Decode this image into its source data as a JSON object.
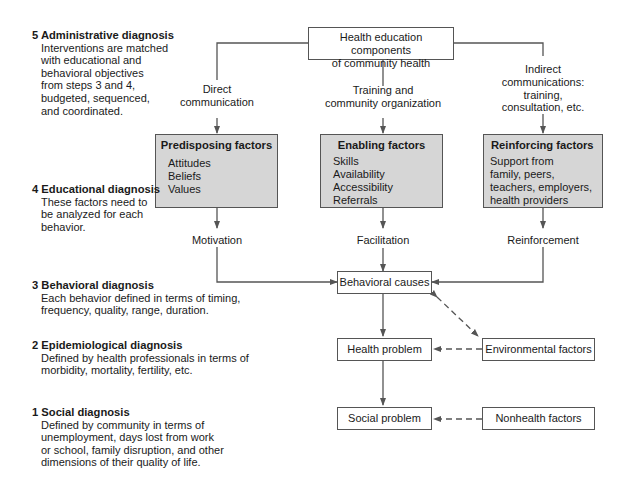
{
  "diagram": {
    "top_box": {
      "line1": "Health education components",
      "line2": "of community health"
    },
    "channels": {
      "direct": {
        "line1": "Direct",
        "line2": "communication"
      },
      "training": {
        "line1": "Training and",
        "line2": "community organization"
      },
      "indirect": {
        "line1": "Indirect",
        "line2": "communications:",
        "line3": "training,",
        "line4": "consultation, etc."
      }
    },
    "factors": {
      "predisposing": {
        "title": "Predisposing factors",
        "items": [
          "Attitudes",
          "Beliefs",
          "Values"
        ]
      },
      "enabling": {
        "title": "Enabling factors",
        "items": [
          "Skills",
          "Availability",
          "Accessibility",
          "Referrals"
        ]
      },
      "reinforcing": {
        "title": "Reinforcing factors",
        "items": [
          "Support from",
          "family, peers,",
          "teachers, employers,",
          "health providers"
        ]
      }
    },
    "outcomes": {
      "motivation": "Motivation",
      "facilitation": "Facilitation",
      "reinforcement": "Reinforcement"
    },
    "nodes": {
      "behavioral_causes": "Behavioral causes",
      "health_problem": "Health problem",
      "social_problem": "Social problem",
      "environmental_factors": "Environmental factors",
      "nonhealth_factors": "Nonhealth factors"
    },
    "steps": [
      {
        "title": "5 Administrative diagnosis",
        "lines": [
          "Interventions are matched",
          "with educational and",
          "behavioral objectives",
          "from steps 3 and 4,",
          "budgeted, sequenced,",
          "and coordinated."
        ]
      },
      {
        "title": "4 Educational diagnosis",
        "lines": [
          "These factors need to",
          "be analyzed for each",
          "behavior."
        ]
      },
      {
        "title": "3 Behavioral diagnosis",
        "lines": [
          "Each behavior defined in terms of timing,",
          "frequency, quality, range, duration."
        ]
      },
      {
        "title": "2 Epidemiological diagnosis",
        "lines": [
          "Defined by health professionals in terms of",
          "morbidity, mortality, fertility, etc."
        ]
      },
      {
        "title": "1 Social diagnosis",
        "lines": [
          "Defined by community in terms of",
          "unemployment, days lost from work",
          "or school, family disruption, and other",
          "dimensions of their quality of life."
        ]
      }
    ],
    "colors": {
      "line": "#555555",
      "factor_fill": "#d6d6d6",
      "text": "#1a1a1a"
    }
  }
}
